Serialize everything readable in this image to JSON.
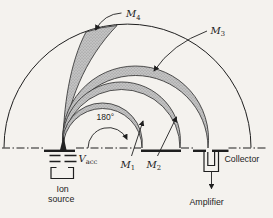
{
  "diagram": {
    "type": "mass-spectrometer-180-degree-sector",
    "labels": {
      "m4_main": "M",
      "m4_sub": "4",
      "m3_main": "M",
      "m3_sub": "3",
      "m2_main": "M",
      "m2_sub": "2",
      "m1_main": "M",
      "m1_sub": "1",
      "angle": "180°",
      "vacc_main": "V",
      "vacc_sub": "acc",
      "ion_source_line1": "Ion",
      "ion_source_line2": "source",
      "collector": "Collector",
      "amplifier": "Amplifier"
    },
    "colors": {
      "background": "#f4f2ee",
      "line": "#1f1f1f",
      "beam_fill": "#c3c3c3",
      "beam_dot": "#8e8e8e"
    }
  }
}
